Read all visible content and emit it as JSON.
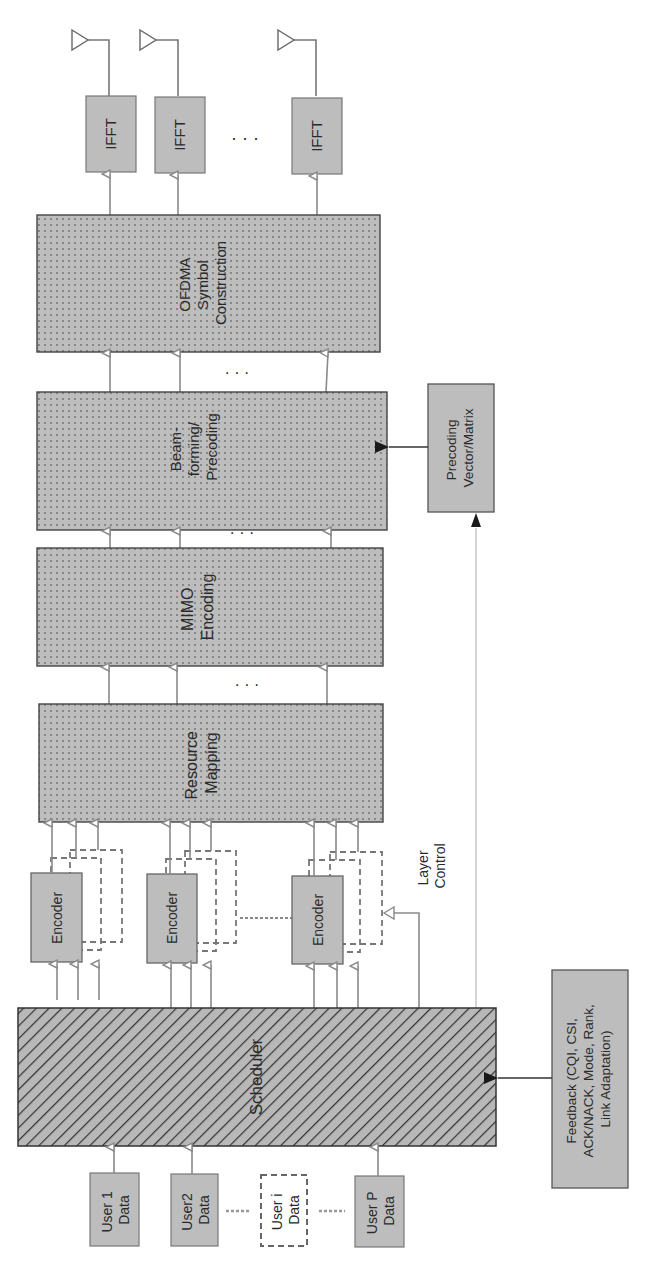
{
  "diagram": {
    "type": "block-diagram",
    "orientation": "rotated-90-ccw",
    "colors": {
      "block_fill": "#bdbdbd",
      "block_stroke": "#555555",
      "arrow_gray": "#8a8a8a",
      "arrow_dark": "#1a1a1a",
      "hatch": "#333333",
      "dots": "#6e6e6e",
      "background": "#ffffff"
    },
    "users": [
      {
        "id": "user-1",
        "label_line1": "User 1",
        "label_line2": "Data",
        "style": "solid"
      },
      {
        "id": "user-2",
        "label_line1": "User2",
        "label_line2": "Data",
        "style": "solid"
      },
      {
        "id": "user-i",
        "label_line1": "User i",
        "label_line2": "Data",
        "style": "dashed"
      },
      {
        "id": "user-p",
        "label_line1": "User P",
        "label_line2": "Data",
        "style": "solid"
      }
    ],
    "scheduler": {
      "label": "Scheduler",
      "pattern": "diagonal-hatch"
    },
    "feedback": {
      "line1": "Feedback (CQI, CSI,",
      "line2": "ACK/NACK, Mode, Rank,",
      "line3": "Link Adaptation)"
    },
    "encoders": [
      {
        "label": "Encoder"
      },
      {
        "label": "Encoder"
      },
      {
        "label": "Encoder"
      }
    ],
    "layer_control": {
      "line1": "Layer",
      "line2": "Control"
    },
    "resource_mapping": {
      "line1": "Resource",
      "line2": "Mapping",
      "pattern": "dotted"
    },
    "mimo_encoding": {
      "line1": "MIMO",
      "line2": "Encoding",
      "pattern": "dotted"
    },
    "beamforming": {
      "line1": "Beam-",
      "line2": "forming/",
      "line3": "Precoding",
      "pattern": "dotted"
    },
    "precoding_matrix": {
      "line1": "Precoding",
      "line2": "Vector/Matrix"
    },
    "ofdma": {
      "line1": "OFDMA",
      "line2": "Symbol",
      "line3": "Construction",
      "pattern": "dotted"
    },
    "iffts": [
      {
        "label": "IFFT"
      },
      {
        "label": "IFFT"
      },
      {
        "label": "IFFT"
      }
    ],
    "ellipsis": "· · ·",
    "antenna_count_visible": 3
  }
}
